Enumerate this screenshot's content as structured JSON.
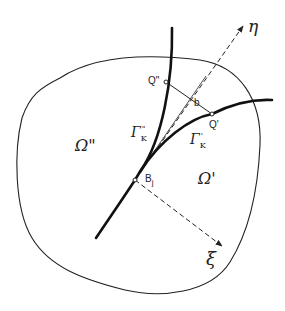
{
  "diagram": {
    "type": "geometric-figure",
    "labels": {
      "omega_double_prime": "Ω\"",
      "omega_prime": "Ω'",
      "gamma_double_prime": "Γ",
      "gamma_double_prime_sub": "K",
      "gamma_double_prime_sup": "\"",
      "gamma_prime": "Γ",
      "gamma_prime_sub": "K",
      "gamma_prime_sup": "'",
      "q_double_prime": "Q\"",
      "q_prime": "Q'",
      "b": "b",
      "bj": "B",
      "bj_sub": "j",
      "eta": "η",
      "xi": "ξ"
    },
    "colors": {
      "ink": "#222222",
      "background": "#ffffff"
    }
  }
}
